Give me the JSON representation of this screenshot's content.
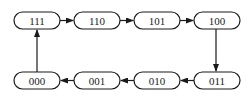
{
  "diagram": {
    "type": "state-transition-cycle",
    "states": [
      {
        "id": "s111",
        "label": "111",
        "x": 14,
        "y": 12,
        "w": 46,
        "h": 17
      },
      {
        "id": "s110",
        "label": "110",
        "x": 74,
        "y": 12,
        "w": 46,
        "h": 17
      },
      {
        "id": "s101",
        "label": "101",
        "x": 134,
        "y": 12,
        "w": 46,
        "h": 17
      },
      {
        "id": "s100",
        "label": "100",
        "x": 194,
        "y": 12,
        "w": 46,
        "h": 17
      },
      {
        "id": "s011",
        "label": "011",
        "x": 194,
        "y": 72,
        "w": 46,
        "h": 17
      },
      {
        "id": "s010",
        "label": "010",
        "x": 134,
        "y": 72,
        "w": 46,
        "h": 17
      },
      {
        "id": "s001",
        "label": "001",
        "x": 74,
        "y": 72,
        "w": 46,
        "h": 17
      },
      {
        "id": "s000",
        "label": "000",
        "x": 14,
        "y": 72,
        "w": 46,
        "h": 17
      }
    ],
    "transitions": [
      {
        "from": "111",
        "to": "110"
      },
      {
        "from": "110",
        "to": "101"
      },
      {
        "from": "101",
        "to": "100"
      },
      {
        "from": "100",
        "to": "011"
      },
      {
        "from": "011",
        "to": "010"
      },
      {
        "from": "010",
        "to": "001"
      },
      {
        "from": "001",
        "to": "000"
      },
      {
        "from": "000",
        "to": "111"
      }
    ],
    "colors": {
      "stroke": "#1a1a1a",
      "fill": "#ffffff"
    }
  }
}
